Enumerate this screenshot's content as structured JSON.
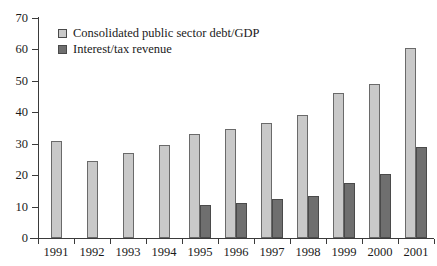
{
  "chart_data": {
    "type": "bar",
    "title": "",
    "subtitle": "",
    "xlabel": "",
    "ylabel": "",
    "ylim": [
      0,
      70
    ],
    "yticks": [
      0,
      10,
      20,
      30,
      40,
      50,
      60,
      70
    ],
    "grid": false,
    "legend_position": "top-left",
    "categories": [
      "1991",
      "1992",
      "1993",
      "1994",
      "1995",
      "1996",
      "1997",
      "1998",
      "1999",
      "2000",
      "2001"
    ],
    "series": [
      {
        "name": "Consolidated public sector debt/GDP",
        "color": "#c9c9c9",
        "values": [
          31,
          24.5,
          27,
          29.5,
          33,
          34.8,
          36.5,
          39.3,
          46,
          49,
          60.5
        ]
      },
      {
        "name": "Interest/tax revenue",
        "color": "#6f6f6f",
        "values": [
          null,
          null,
          null,
          null,
          10.5,
          11.3,
          12.3,
          13.5,
          17.5,
          20.5,
          29
        ]
      }
    ]
  },
  "legend": {
    "items": [
      {
        "label": "Consolidated public sector debt/GDP",
        "swatch": "series-light"
      },
      {
        "label": "Interest/tax revenue",
        "swatch": "series-dark"
      }
    ]
  }
}
